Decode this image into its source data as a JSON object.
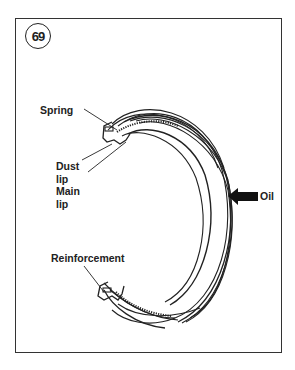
{
  "figure": {
    "number": "69"
  },
  "labels": {
    "spring": "Spring",
    "dust_lip_line1": "Dust",
    "dust_lip_line2": "lip",
    "main_lip_line1": "Main",
    "main_lip_line2": "lip",
    "oil": "Oil",
    "reinforcement": "Reinforcement"
  },
  "icons": {
    "oil_direction": "left-arrow-icon"
  },
  "colors": {
    "line": "#222222",
    "background": "#ffffff"
  }
}
